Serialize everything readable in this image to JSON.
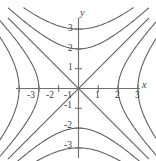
{
  "figure": {
    "name": "hyperbola-family-contour-plot",
    "background_color": "#ffffff",
    "curve_color": "#5c5c5c",
    "axis_color": "#6f6f6f",
    "text_color": "#3a3a3a"
  },
  "axes": {
    "x_label": "x",
    "y_label": "y",
    "x_ticks": [
      {
        "value": -3,
        "label": "-3"
      },
      {
        "value": -2,
        "label": "-2"
      },
      {
        "value": -1,
        "label": "-1"
      },
      {
        "value": 1,
        "label": "1"
      },
      {
        "value": 2,
        "label": "2"
      },
      {
        "value": 3,
        "label": "3"
      }
    ],
    "y_ticks": [
      {
        "value": 3,
        "label": "3"
      },
      {
        "value": 2,
        "label": "2"
      },
      {
        "value": 1,
        "label": "1"
      },
      {
        "value": -1,
        "label": "-1"
      },
      {
        "value": -2,
        "label": "-2"
      },
      {
        "value": -3,
        "label": "-3"
      }
    ]
  },
  "chart_data": {
    "type": "line",
    "title": "",
    "subtitle": "",
    "xlabel": "x",
    "ylabel": "y",
    "xlim": [
      -3.8,
      3.8
    ],
    "ylim": [
      -3.8,
      3.8
    ],
    "grid": false,
    "legend": "none",
    "equation_family": "x^2 - y^2 = c",
    "asymptotes": [
      "y = x",
      "y = -x"
    ],
    "series": [
      {
        "name": "x^2 - y^2 = 4 (right branch)",
        "c": 4,
        "orientation": "horizontal",
        "vertex": [
          2,
          0
        ]
      },
      {
        "name": "x^2 - y^2 = 9 (right branch)",
        "c": 9,
        "orientation": "horizontal",
        "vertex": [
          3,
          0
        ]
      },
      {
        "name": "x^2 - y^2 = 4 (left branch)",
        "c": 4,
        "orientation": "horizontal",
        "vertex": [
          -2,
          0
        ]
      },
      {
        "name": "x^2 - y^2 = 9 (left branch)",
        "c": 9,
        "orientation": "horizontal",
        "vertex": [
          -3,
          0
        ]
      },
      {
        "name": "x^2 - y^2 = -4 (upper branch)",
        "c": -4,
        "orientation": "vertical",
        "vertex": [
          0,
          2
        ]
      },
      {
        "name": "x^2 - y^2 = -9 (upper branch)",
        "c": -9,
        "orientation": "vertical",
        "vertex": [
          0,
          3
        ]
      },
      {
        "name": "x^2 - y^2 = -4 (lower branch)",
        "c": -4,
        "orientation": "vertical",
        "vertex": [
          0,
          -2
        ]
      },
      {
        "name": "x^2 - y^2 = -9 (lower branch)",
        "c": -9,
        "orientation": "vertical",
        "vertex": [
          0,
          -3
        ]
      },
      {
        "name": "x^2 - y^2 = 0 (asymptote y = x)",
        "c": 0,
        "orientation": "diagonal",
        "vertex": [
          0,
          0
        ]
      },
      {
        "name": "x^2 - y^2 = 0 (asymptote y = -x)",
        "c": 0,
        "orientation": "diagonal",
        "vertex": [
          0,
          0
        ]
      }
    ]
  }
}
